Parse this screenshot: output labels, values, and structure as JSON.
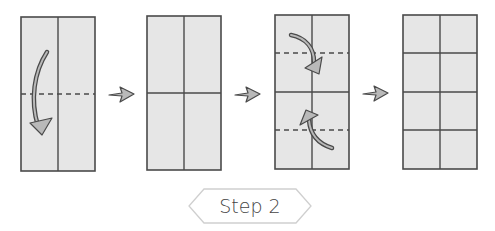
{
  "diagram": {
    "type": "origami-fold-instructions",
    "step_label": "Step 2",
    "panels": [
      {
        "name": "panel-1",
        "vertical_creases": 1,
        "horizontal_creases": 0,
        "fold_lines": [
          "middle"
        ],
        "fold_arrows": [
          "top-half-down"
        ]
      },
      {
        "name": "panel-2",
        "vertical_creases": 1,
        "horizontal_creases": 1,
        "fold_lines": [],
        "fold_arrows": []
      },
      {
        "name": "panel-3",
        "vertical_creases": 1,
        "horizontal_creases": 1,
        "fold_lines": [
          "upper-quarter",
          "lower-quarter"
        ],
        "fold_arrows": [
          "top-down-to-center",
          "bottom-up-to-center"
        ]
      },
      {
        "name": "panel-4",
        "vertical_creases": 1,
        "horizontal_creases": 3,
        "fold_lines": [],
        "fold_arrows": []
      }
    ],
    "transition_arrows": 3,
    "colors": {
      "paper": "#e6e6e6",
      "line": "#4a4a4a",
      "arrow": "#b9b9b9",
      "badge_border": "#cfcfcf",
      "badge_text": "#444444"
    }
  }
}
